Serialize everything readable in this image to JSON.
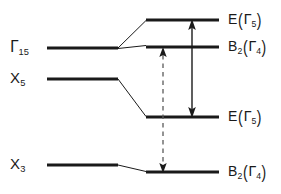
{
  "figure": {
    "kind": "energy-level-correlation-diagram",
    "background_color": "#ffffff",
    "line_color": "#1a1a1a",
    "level_line_width": 3.2,
    "connector_line_width": 1.0,
    "arrow_line_width": 1.4
  },
  "left_labels": [
    {
      "id": "gamma15",
      "symbol": "Γ",
      "subscript": "15",
      "x": 12,
      "y": 48
    },
    {
      "id": "x5",
      "symbol": "X",
      "subscript": "5",
      "x": 12,
      "y": 79
    },
    {
      "id": "x3",
      "symbol": "X",
      "subscript": "3",
      "x": 12,
      "y": 165
    }
  ],
  "right_labels": [
    {
      "id": "e-gamma5-upper",
      "main": "E",
      "paren_symbol": "Γ",
      "paren_subscript": "5",
      "x": 228,
      "y": 20
    },
    {
      "id": "b2-gamma4-upper",
      "main": "B",
      "main_subscript": "2",
      "paren_symbol": "Γ",
      "paren_subscript": "4",
      "x": 228,
      "y": 48
    },
    {
      "id": "e-gamma5-lower",
      "main": "E",
      "paren_symbol": "Γ",
      "paren_subscript": "5",
      "x": 228,
      "y": 117
    },
    {
      "id": "b2-gamma4-lower",
      "main": "B",
      "main_subscript": "2",
      "paren_symbol": "Γ",
      "paren_subscript": "4",
      "x": 228,
      "y": 172
    }
  ],
  "levels": {
    "left": [
      {
        "id": "level-gamma15",
        "x1": 47,
        "x2": 118,
        "y": 48
      },
      {
        "id": "level-x5",
        "x1": 47,
        "x2": 118,
        "y": 79
      },
      {
        "id": "level-x3",
        "x1": 47,
        "x2": 118,
        "y": 165
      }
    ],
    "right": [
      {
        "id": "level-e-gamma5-upper",
        "x1": 146,
        "x2": 219,
        "y": 20
      },
      {
        "id": "level-b2-gamma4-upper",
        "x1": 146,
        "x2": 219,
        "y": 48
      },
      {
        "id": "level-e-gamma5-lower",
        "x1": 146,
        "x2": 219,
        "y": 117
      },
      {
        "id": "level-b2-gamma4-lower",
        "x1": 146,
        "x2": 219,
        "y": 172
      }
    ]
  },
  "connectors": [
    {
      "id": "connector-gamma15-to-e-upper",
      "x1": 118,
      "y1": 48,
      "x2": 146,
      "y2": 20
    },
    {
      "id": "connector-gamma15-to-b2-upper",
      "x1": 118,
      "y1": 48,
      "x2": 146,
      "y2": 45
    },
    {
      "id": "connector-x5-to-e-lower",
      "x1": 118,
      "y1": 79,
      "x2": 146,
      "y2": 117
    },
    {
      "id": "connector-x3-to-b2-lower",
      "x1": 118,
      "y1": 165,
      "x2": 146,
      "y2": 172
    }
  ],
  "arrows": [
    {
      "id": "transition-arrow-dashed",
      "style": "dashed",
      "x": 163,
      "y_top": 48,
      "y_bottom": 172,
      "double_headed": true
    },
    {
      "id": "transition-arrow-solid",
      "style": "solid",
      "x": 192,
      "y_top": 20,
      "y_bottom": 117,
      "double_headed": true
    }
  ]
}
